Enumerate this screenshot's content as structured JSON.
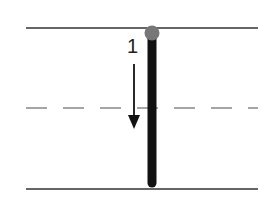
{
  "diagram": {
    "step_label": "1",
    "colors": {
      "line": "#333333",
      "dashed": "#888888",
      "bar": "#111111",
      "dot": "#777777",
      "arrow": "#111111"
    }
  }
}
